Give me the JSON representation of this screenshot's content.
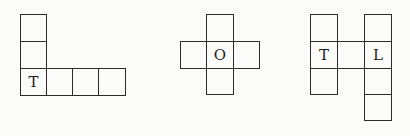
{
  "figures": [
    {
      "name": "figure-l-shape",
      "cells": [
        {
          "x": 20,
          "y": 14,
          "w": 27,
          "h": 28,
          "label": ""
        },
        {
          "x": 20,
          "y": 41,
          "w": 27,
          "h": 28,
          "label": ""
        },
        {
          "x": 20,
          "y": 68,
          "w": 27,
          "h": 28,
          "label": "T"
        },
        {
          "x": 46,
          "y": 68,
          "w": 27,
          "h": 28,
          "label": ""
        },
        {
          "x": 72,
          "y": 68,
          "w": 27,
          "h": 28,
          "label": ""
        },
        {
          "x": 98,
          "y": 68,
          "w": 28,
          "h": 28,
          "label": ""
        }
      ]
    },
    {
      "name": "figure-cross-shape",
      "cells": [
        {
          "x": 206,
          "y": 14,
          "w": 28,
          "h": 28,
          "label": ""
        },
        {
          "x": 180,
          "y": 41,
          "w": 27,
          "h": 28,
          "label": ""
        },
        {
          "x": 206,
          "y": 41,
          "w": 28,
          "h": 28,
          "label": "O"
        },
        {
          "x": 233,
          "y": 41,
          "w": 27,
          "h": 28,
          "label": ""
        },
        {
          "x": 206,
          "y": 68,
          "w": 28,
          "h": 27,
          "label": ""
        }
      ]
    },
    {
      "name": "figure-h-shape",
      "cells": [
        {
          "x": 310,
          "y": 14,
          "w": 28,
          "h": 28,
          "label": ""
        },
        {
          "x": 310,
          "y": 41,
          "w": 28,
          "h": 28,
          "label": "T"
        },
        {
          "x": 310,
          "y": 68,
          "w": 28,
          "h": 27,
          "label": ""
        },
        {
          "x": 337,
          "y": 41,
          "w": 28,
          "h": 28,
          "label": ""
        },
        {
          "x": 364,
          "y": 14,
          "w": 28,
          "h": 28,
          "label": ""
        },
        {
          "x": 364,
          "y": 41,
          "w": 28,
          "h": 28,
          "label": "L"
        },
        {
          "x": 364,
          "y": 68,
          "w": 28,
          "h": 27,
          "label": ""
        },
        {
          "x": 364,
          "y": 94,
          "w": 28,
          "h": 27,
          "label": ""
        }
      ]
    }
  ],
  "colors": {
    "line": "#2b2b2b",
    "text": "#1e1e1e",
    "background": "#fbfbfa"
  }
}
